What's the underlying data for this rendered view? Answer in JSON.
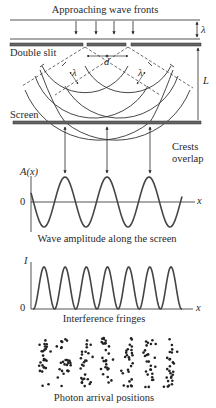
{
  "labels": {
    "approaching": "Approaching wave fronts",
    "lambda_top": "λ",
    "double_slit": "Double slit",
    "d": "d",
    "L": "L",
    "lambda_left": "λ",
    "lambda_right": "λ",
    "screen": "Screen",
    "crests_line1": "Crests",
    "crests_line2": "overlap",
    "amp_axis": "A(x)",
    "amp_zero": "0",
    "amp_x": "x",
    "amp_caption": "Wave amplitude along the screen",
    "int_axis": "I",
    "int_zero": "0",
    "int_x": "x",
    "int_caption": "Interference fringes",
    "photon_caption": "Photon arrival positions"
  },
  "colors": {
    "ink": "#2a2a2a",
    "bar": "#555555",
    "curve": "#444444"
  },
  "geometry": {
    "slit_x": [
      85,
      128
    ],
    "crest_overlap_x": [
      65,
      107,
      150
    ],
    "fringe_peak_x": [
      44,
      65,
      86,
      107,
      129,
      150,
      171
    ]
  },
  "chart_data": [
    {
      "type": "line",
      "title": "Wave amplitude along the screen",
      "xlabel": "x",
      "ylabel": "A(x)",
      "series": [
        {
          "name": "A(x)",
          "shape": "cosine",
          "peaks_at_crest_overlap": true,
          "num_peaks": 3
        }
      ]
    },
    {
      "type": "line",
      "title": "Interference fringes",
      "xlabel": "x",
      "ylabel": "I",
      "series": [
        {
          "name": "I",
          "shape": "cos^2",
          "num_peaks": 7,
          "min": 0
        }
      ]
    },
    {
      "type": "scatter",
      "title": "Photon arrival positions",
      "columns": 7
    }
  ]
}
